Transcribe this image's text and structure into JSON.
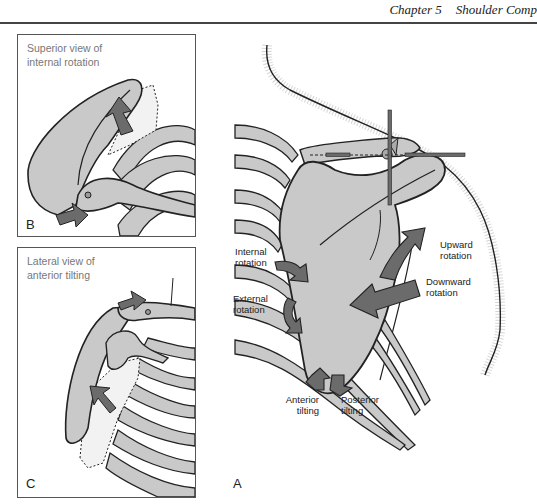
{
  "running_head": {
    "chapter": "Chapter 5",
    "title": "Shoulder Comp"
  },
  "figure": {
    "panel_b": {
      "title_line1": "Superior view of",
      "title_line2": "internal rotation",
      "letter": "B"
    },
    "panel_c": {
      "title_line1": "Lateral view of",
      "title_line2": "anterior tilting",
      "letter": "C"
    },
    "panel_a": {
      "letter": "A",
      "labels": {
        "internal_rotation": [
          "Internal",
          "rotation"
        ],
        "external_rotation": [
          "External",
          "rotation"
        ],
        "upward_rotation": [
          "Upward",
          "rotation"
        ],
        "downward_rotation": [
          "Downward",
          "rotation"
        ],
        "anterior_tilting": [
          "Anterior",
          "tilting"
        ],
        "posterior_tilting": [
          "Posterior",
          "tilting"
        ]
      }
    },
    "colors": {
      "bone": "#c9c9c9",
      "arrow": "#6b6b6b",
      "stroke": "#222222",
      "ghost": "#f2f2f2"
    }
  }
}
